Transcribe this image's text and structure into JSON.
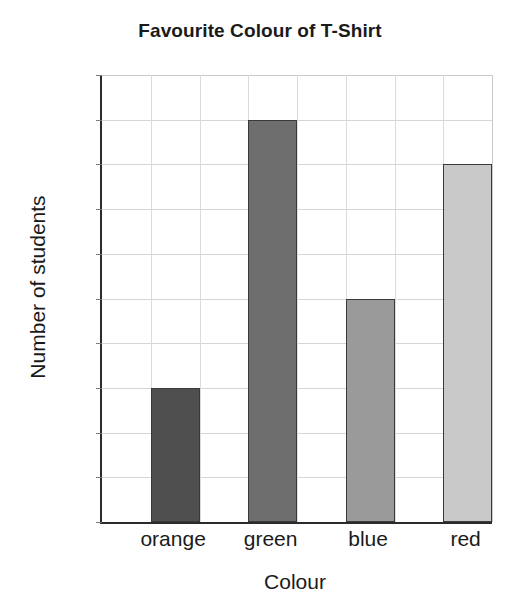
{
  "chart_data": {
    "type": "bar",
    "title": "Favourite Colour of T-Shirt",
    "xlabel": "Colour",
    "ylabel": "Number of students",
    "categories": [
      "orange",
      "green",
      "blue",
      "red"
    ],
    "values": [
      3,
      9,
      5,
      8
    ],
    "ylim": [
      0,
      10
    ],
    "ytick_labels": [
      "0",
      "1",
      "2",
      "3",
      "4",
      "5",
      "6",
      "7",
      "8",
      "9",
      "10"
    ],
    "ytick_values": [
      0,
      1,
      2,
      3,
      4,
      5,
      6,
      7,
      8,
      9,
      10
    ],
    "grid": "both",
    "legend": "none",
    "bar_colors": [
      "#4f4f4f",
      "#6e6e6e",
      "#9a9a9a",
      "#c9c9c9"
    ],
    "bar_edge_color": "#3a3a3a",
    "axis_color": "#2b2b2b",
    "gridline_color": "#d8d8d8",
    "text_color": "#1a1a1a"
  }
}
